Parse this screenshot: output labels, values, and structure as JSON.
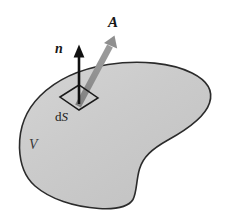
{
  "figure": {
    "canvas": {
      "width": 227,
      "height": 222,
      "background": "#ffffff"
    },
    "labels": {
      "vector_A": "A",
      "normal_n": "n",
      "surface_element_prefix": "d",
      "surface_element_symbol": "S",
      "volume_V": "V"
    },
    "colors": {
      "blob_fill": "#c9c9c9",
      "blob_fill_light": "#d6d6d6",
      "blob_outline": "#2b2b2b",
      "vector_A_color": "#8a8a8a",
      "normal_n_color": "#111111",
      "patch_outline": "#1a1a1a",
      "label_color": "#161616",
      "volume_label_color": "#3a3a3a"
    },
    "geometry": {
      "blob_path": "M 19.5 148 C 19.0 128 26 110 40 96 C 56 80 80 69 108 64.5 C 140 59.5 172 63 192 73 C 208 81 213.5 91 209.5 103 C 205 117 188 129 168 140 C 152 149 143 157 139.5 169 C 136 181 137 192 133 199.5 C 128.5 207 117 209.5 99 208.5 C 74 207 50 199 35 186 C 23.5 176 20 162 19.5 148 Z",
      "patch_points": "60,97 79,85 98,98 79,110",
      "normal_arrow": {
        "x1": 79,
        "y1": 103,
        "x2": 79,
        "y2": 46
      },
      "vector_A_arrow": {
        "x1": 78,
        "y1": 104,
        "x2": 114.5,
        "y2": 36
      }
    }
  }
}
